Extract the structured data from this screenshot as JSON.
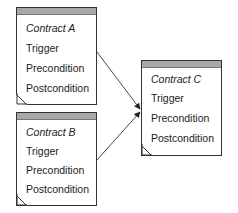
{
  "contracts": [
    {
      "title": "Contract A",
      "fields": [
        "Trigger",
        "Precondition",
        "Postcondition"
      ]
    },
    {
      "title": "Contract B",
      "fields": [
        "Trigger",
        "Precondition",
        "Postcondition"
      ]
    },
    {
      "title": "Contract C",
      "fields": [
        "Trigger",
        "Precondition",
        "Postcondition"
      ]
    }
  ],
  "connections": [
    {
      "from": "Contract A",
      "to": "Contract C"
    },
    {
      "from": "Contract B",
      "to": "Contract C"
    }
  ],
  "colors": {
    "header": "#a8a8a8",
    "border": "#333333",
    "arrow": "#333333"
  }
}
